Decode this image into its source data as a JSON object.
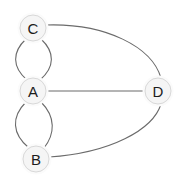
{
  "diagram": {
    "type": "multigraph",
    "title": "",
    "width": 183,
    "height": 179,
    "background_color": "#ffffff",
    "node_fill_color": "#f5f5f5",
    "node_stroke_color": "#d8d8d8",
    "edge_color": "#6b6b6b",
    "label_color": "#1c1c1c",
    "nodes": [
      {
        "id": "C",
        "label": "C",
        "cx": 33,
        "cy": 28,
        "r": 13
      },
      {
        "id": "A",
        "label": "A",
        "cx": 33,
        "cy": 91,
        "r": 13
      },
      {
        "id": "B",
        "label": "B",
        "cx": 36,
        "cy": 159,
        "r": 13
      },
      {
        "id": "D",
        "label": "D",
        "cx": 158,
        "cy": 91,
        "r": 13
      }
    ],
    "edges": [
      {
        "id": "edge-C-A-left",
        "source": "C",
        "target": "A",
        "style": "curved",
        "multiplicity_index": 1,
        "path": "M 26,39 C 12,52 12,67 27,80"
      },
      {
        "id": "edge-C-A-right",
        "source": "C",
        "target": "A",
        "style": "curved",
        "multiplicity_index": 2,
        "path": "M 41,39 C 55,52 55,67 40,80"
      },
      {
        "id": "edge-A-B-left",
        "source": "A",
        "target": "B",
        "style": "curved",
        "multiplicity_index": 1,
        "path": "M 26,102 C 11,117 12,134 29,148"
      },
      {
        "id": "edge-A-B-right",
        "source": "A",
        "target": "B",
        "style": "curved",
        "multiplicity_index": 2,
        "path": "M 41,102 C 56,117 55,134 44,148"
      },
      {
        "id": "edge-A-D",
        "source": "A",
        "target": "D",
        "style": "straight",
        "multiplicity_index": 1,
        "path": "M 46,91 L 145,91"
      },
      {
        "id": "edge-C-D",
        "source": "C",
        "target": "D",
        "style": "curved",
        "multiplicity_index": 1,
        "path": "M 46,25 C 106,23 152,47 161,78"
      },
      {
        "id": "edge-B-D",
        "source": "B",
        "target": "D",
        "style": "curved",
        "multiplicity_index": 1,
        "path": "M 49,157 C 110,153 153,130 161,104"
      }
    ]
  }
}
